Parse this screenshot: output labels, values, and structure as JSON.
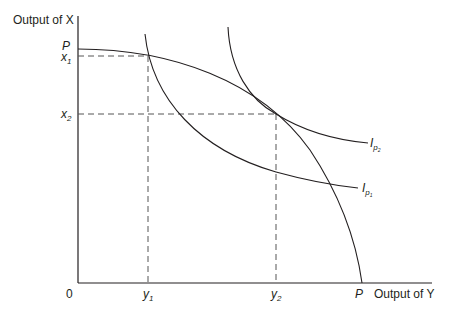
{
  "diagram": {
    "type": "production-possibility-frontier",
    "y_axis_label": "Output of X",
    "x_axis_label": "Output of Y",
    "origin_label": "0",
    "ppf_label_y": "P",
    "ppf_label_x": "P",
    "x_ticks": [
      {
        "base": "y",
        "sub": "1"
      },
      {
        "base": "y",
        "sub": "2"
      }
    ],
    "y_ticks": [
      {
        "base": "x",
        "sub": "1"
      },
      {
        "base": "x",
        "sub": "2"
      }
    ],
    "curves": [
      {
        "name": "PP",
        "label": "production possibility frontier"
      },
      {
        "name": "Ip1",
        "base": "I",
        "sub": "p",
        "subsub": "1"
      },
      {
        "name": "Ip2",
        "base": "I",
        "sub": "p",
        "subsub": "2"
      }
    ],
    "colors": {
      "line": "#231f20",
      "dash": "#555555",
      "background": "#ffffff"
    }
  }
}
